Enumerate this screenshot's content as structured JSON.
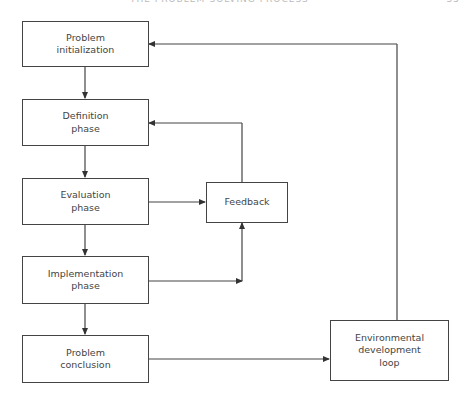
{
  "header": {
    "running_title": "THE PROBLEM-SOLVING PROCESS",
    "page_number": "35"
  },
  "diagram": {
    "nodes": [
      {
        "id": "init",
        "lines": [
          "Problem",
          "initialization"
        ]
      },
      {
        "id": "definition",
        "lines": [
          "Definition",
          "phase"
        ]
      },
      {
        "id": "evaluation",
        "lines": [
          "Evaluation",
          "phase"
        ]
      },
      {
        "id": "implementation",
        "lines": [
          "Implementation",
          "phase"
        ]
      },
      {
        "id": "conclusion",
        "lines": [
          "Problem",
          "conclusion"
        ]
      },
      {
        "id": "feedback",
        "lines": [
          "Feedback"
        ]
      },
      {
        "id": "environment",
        "lines": [
          "Environmental",
          "development",
          "loop"
        ]
      }
    ],
    "edges": [
      {
        "from": "init",
        "to": "definition"
      },
      {
        "from": "definition",
        "to": "evaluation"
      },
      {
        "from": "evaluation",
        "to": "implementation"
      },
      {
        "from": "implementation",
        "to": "conclusion"
      },
      {
        "from": "evaluation",
        "to": "feedback"
      },
      {
        "from": "implementation",
        "to": "feedback"
      },
      {
        "from": "feedback",
        "to": "definition"
      },
      {
        "from": "conclusion",
        "to": "environment"
      },
      {
        "from": "environment",
        "to": "init"
      }
    ]
  }
}
